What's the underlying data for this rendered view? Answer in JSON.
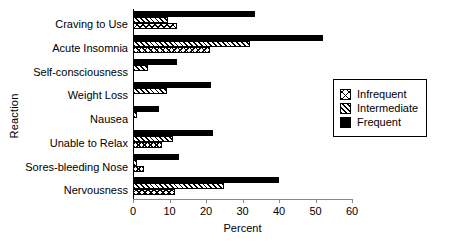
{
  "chart_data": {
    "type": "bar",
    "orientation": "horizontal",
    "title": "",
    "xlabel": "Percent",
    "ylabel": "Reaction",
    "xlim": [
      0,
      60
    ],
    "xticks": [
      0,
      10,
      20,
      30,
      40,
      50,
      60
    ],
    "grid": false,
    "legend_position": "right",
    "categories": [
      "Craving to Use",
      "Acute Insomnia",
      "Self-consciousness",
      "Weight Loss",
      "Nausea",
      "Unable to Relax",
      "Sores-bleeding Nose",
      "Nervousness"
    ],
    "series": [
      {
        "name": "Infrequent",
        "pattern": "cross-hatch",
        "values": [
          12,
          21,
          0,
          0,
          0,
          8,
          3,
          11.5
        ]
      },
      {
        "name": "Intermediate",
        "pattern": "diagonal-hatch",
        "values": [
          9.5,
          32,
          4,
          9.3,
          1,
          11,
          1,
          25
        ]
      },
      {
        "name": "Frequent",
        "pattern": "solid-black",
        "values": [
          33.5,
          52,
          12,
          21.5,
          7,
          22,
          12.5,
          40
        ]
      }
    ]
  },
  "legend": {
    "items": [
      {
        "label": "Infrequent"
      },
      {
        "label": "Intermediate"
      },
      {
        "label": "Frequent"
      }
    ]
  }
}
